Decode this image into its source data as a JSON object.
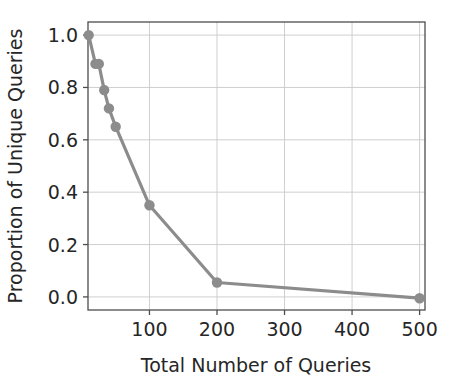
{
  "chart_data": {
    "type": "line",
    "title": "",
    "xlabel": "Total Number of Queries",
    "ylabel": "Proportion of Unique Queries",
    "xlim": [
      9,
      508
    ],
    "ylim": [
      -0.05,
      1.05
    ],
    "xticks": [
      100,
      200,
      300,
      400,
      500
    ],
    "xtick_labels": [
      "100",
      "200",
      "300",
      "400",
      "500"
    ],
    "yticks": [
      0.0,
      0.2,
      0.4,
      0.6,
      0.8,
      1.0
    ],
    "ytick_labels": [
      "0.0",
      "0.2",
      "0.4",
      "0.6",
      "0.8",
      "1.0"
    ],
    "grid": true,
    "legend": null,
    "x": [
      10,
      20,
      25,
      33,
      40,
      50,
      100,
      200,
      500
    ],
    "y": [
      1.0,
      0.89,
      0.89,
      0.79,
      0.72,
      0.65,
      0.35,
      0.055,
      -0.005
    ],
    "series": [
      {
        "name": "Proportion of Unique Queries",
        "points": [
          {
            "x": 10,
            "y": 1.0
          },
          {
            "x": 20,
            "y": 0.89
          },
          {
            "x": 25,
            "y": 0.89
          },
          {
            "x": 33,
            "y": 0.79
          },
          {
            "x": 40,
            "y": 0.72
          },
          {
            "x": 50,
            "y": 0.65
          },
          {
            "x": 100,
            "y": 0.35
          },
          {
            "x": 200,
            "y": 0.055
          },
          {
            "x": 500,
            "y": -0.005
          }
        ],
        "line_color": "#8c8c8c",
        "marker_color": "#8c8c8c",
        "marker": "circle"
      }
    ],
    "colors": {
      "line": "#8c8c8c",
      "marker": "#8c8c8c",
      "grid": "#c9c9c9",
      "axis": "#4d4d4d",
      "text": "#262626",
      "background": "#ffffff"
    }
  }
}
